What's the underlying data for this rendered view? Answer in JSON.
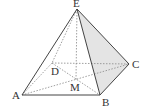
{
  "diagram": {
    "type": "square pyramid",
    "points": {
      "E": {
        "label": "E",
        "x": 77,
        "y": 9
      },
      "A": {
        "label": "A",
        "x": 22,
        "y": 95
      },
      "B": {
        "label": "B",
        "x": 100,
        "y": 95
      },
      "C": {
        "label": "C",
        "x": 129,
        "y": 64
      },
      "D": {
        "label": "D",
        "x": 52,
        "y": 63
      },
      "M": {
        "label": "M",
        "x": 76,
        "y": 80
      }
    },
    "shaded_face": "EBC",
    "colors": {
      "line": "#444444",
      "hidden_line": "#888888",
      "shade": "#e4e4e4"
    }
  }
}
